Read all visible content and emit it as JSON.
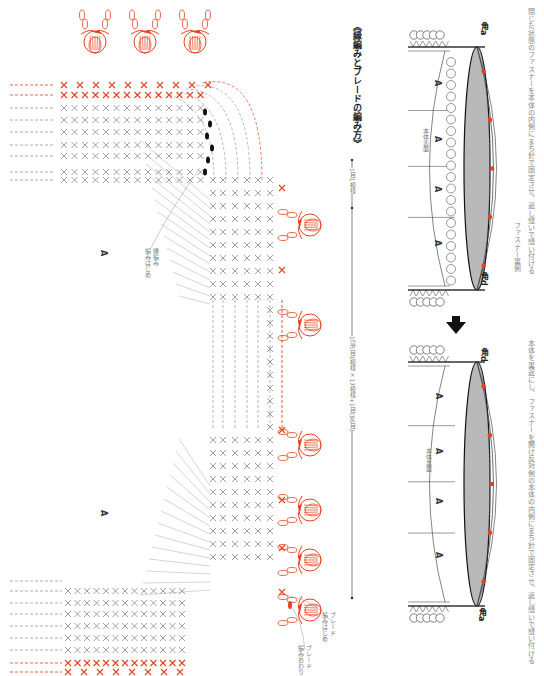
{
  "captions": {
    "step1": "閉じた状態のファスナーを本体の内側にまち針で固定させ、返し縫いで縫い付ける",
    "step1_callout": "ファスナー裏側",
    "step2": "本体を裏返にし、ファスナーを開け反対側の本体の内側にまち針で固定させ、返し縫いで縫い付ける"
  },
  "step1_diagram": {
    "corner_top": "角a",
    "corner_bottom": "角d",
    "face_label": "本体表面",
    "section_label": "A"
  },
  "step2_diagram": {
    "corner_top": "角d",
    "corner_bottom": "角a",
    "face_label": "本体裏面",
    "section_label": "A"
  },
  "arrow": {
    "icon": "down-arrow-icon"
  },
  "chart": {
    "title": "《縁編みとブレードの編み方》",
    "repeat_1": "1目1模様",
    "repeat_2": "1辺5目1模様×17模様+1目(86目)",
    "edge_start": "縁編み\n編みはじめ",
    "braid_start": "ブレード\n編みはじめ",
    "braid_end": "ブレード\n編みおわり",
    "section_label": "A",
    "colors": {
      "accent": "#e8401c",
      "stitch": "#777777",
      "line": "#333333"
    }
  }
}
